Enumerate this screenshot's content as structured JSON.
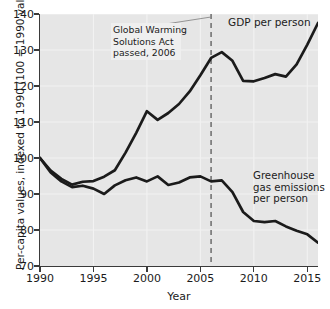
{
  "chart_data": {
    "type": "line",
    "title": "",
    "xlabel": "Year",
    "ylabel": "Per-capita values, indexed to 1990 (100 = 1990 values)",
    "xlim": [
      1990,
      2016
    ],
    "ylim": [
      70,
      140
    ],
    "xticks": [
      "1990",
      "1995",
      "2000",
      "2005",
      "2010",
      "2015"
    ],
    "xtick_values": [
      1990,
      1995,
      2000,
      2005,
      2010,
      2015
    ],
    "yticks": [
      "70",
      "80",
      "90",
      "100",
      "110",
      "120",
      "130",
      "140"
    ],
    "ytick_values": [
      70,
      80,
      90,
      100,
      110,
      120,
      130,
      140
    ],
    "grid": true,
    "legend_position": "inline-labels",
    "x": [
      1990,
      1991,
      1992,
      1993,
      1994,
      1995,
      1996,
      1997,
      1998,
      1999,
      2000,
      2001,
      2002,
      2003,
      2004,
      2005,
      2006,
      2007,
      2008,
      2009,
      2010,
      2011,
      2012,
      2013,
      2014,
      2015,
      2016
    ],
    "series": [
      {
        "name": "GDP per person",
        "color": "#1b1b1b",
        "values": [
          100.0,
          96.5,
          94.2,
          92.6,
          93.4,
          93.6,
          94.8,
          96.6,
          101.5,
          107.0,
          113.0,
          110.6,
          112.5,
          115.0,
          118.5,
          123.0,
          127.8,
          129.4,
          127.0,
          121.4,
          121.3,
          122.2,
          123.3,
          122.6,
          126.0,
          131.5,
          137.5
        ]
      },
      {
        "name": "Greenhouse gas emissions per person",
        "color": "#1b1b1b",
        "values": [
          100.0,
          96.0,
          93.5,
          91.9,
          92.3,
          91.5,
          90.0,
          92.4,
          93.8,
          94.6,
          93.5,
          94.9,
          92.5,
          93.2,
          94.6,
          94.9,
          93.5,
          93.8,
          90.5,
          85.0,
          82.5,
          82.2,
          82.5,
          81.0,
          79.8,
          78.8,
          76.5
        ]
      }
    ],
    "annotations": [
      {
        "name": "global-warming-solutions-act",
        "lines": [
          "Global Warming",
          "Solutions Act",
          "passed, 2006"
        ],
        "marker_year": 2006,
        "marker_style": "dashed-vertical-line"
      }
    ]
  },
  "colors": {
    "plot_background": "#e6e6e6",
    "figure_background": "#ffffff",
    "axis": "#3a3a3a",
    "line": "#1b1b1b",
    "gridline": "#f2f2f2",
    "marker_line": "#6b6b6b",
    "annotation_background": "#efefef"
  }
}
